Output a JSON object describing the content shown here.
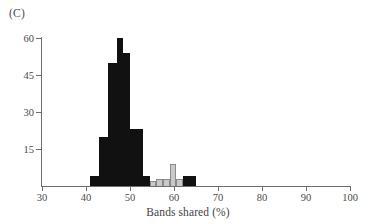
{
  "panel": {
    "label": "(C)"
  },
  "chart_data": {
    "type": "bar",
    "title": "",
    "subtitle": "",
    "xlabel": "Bands shared (%)",
    "ylabel": "",
    "xlim": [
      30,
      100
    ],
    "ylim": [
      0,
      60
    ],
    "grid": false,
    "legend": "none",
    "xticks": [
      30,
      40,
      50,
      60,
      70,
      80,
      90,
      100
    ],
    "xtick_labels": [
      "30",
      "40",
      "50",
      "60",
      "70",
      "80",
      "90",
      "100"
    ],
    "yticks": [
      15,
      30,
      45,
      60
    ],
    "ytick_labels": [
      "15",
      "30",
      "45",
      "60"
    ],
    "colors": {
      "dark": "#111111",
      "light": "#c9c9c9",
      "light_edge": "#8a8a8a",
      "axis": "#6e6e6e",
      "text": "#4a4a4a"
    },
    "series": [
      {
        "name": "within-population comparisons",
        "color": "#111111",
        "bins": [
          {
            "x0": 41.0,
            "x1": 43.0,
            "value": 4
          },
          {
            "x0": 43.0,
            "x1": 45.0,
            "value": 20
          },
          {
            "x0": 45.0,
            "x1": 47.0,
            "value": 50
          },
          {
            "x0": 47.0,
            "x1": 48.5,
            "value": 60
          },
          {
            "x0": 48.5,
            "x1": 50.0,
            "value": 54
          },
          {
            "x0": 50.0,
            "x1": 53.0,
            "value": 23
          },
          {
            "x0": 53.0,
            "x1": 54.5,
            "value": 4
          },
          {
            "x0": 62.0,
            "x1": 64.0,
            "value": 4
          },
          {
            "x0": 64.0,
            "x1": 65.0,
            "value": 4
          }
        ]
      },
      {
        "name": "between-population comparisons",
        "color": "#c9c9c9",
        "bins": [
          {
            "x0": 54.5,
            "x1": 56.0,
            "value": 2
          },
          {
            "x0": 56.0,
            "x1": 57.5,
            "value": 3
          },
          {
            "x0": 57.5,
            "x1": 59.0,
            "value": 3
          },
          {
            "x0": 59.0,
            "x1": 60.5,
            "value": 9
          },
          {
            "x0": 60.5,
            "x1": 62.0,
            "value": 3
          }
        ]
      }
    ]
  }
}
